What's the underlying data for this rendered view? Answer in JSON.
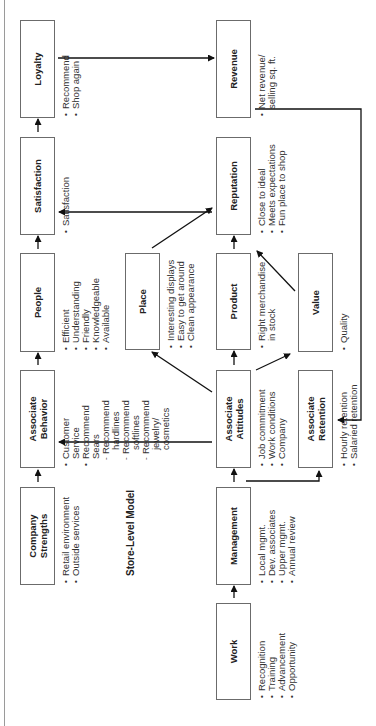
{
  "title": "Store-Level Model",
  "boxes": {
    "loyalty": {
      "label": "Loyalty",
      "bullets": [
        "Recommend",
        "Shop again"
      ]
    },
    "satisfaction": {
      "label": "Satisfaction",
      "bullets": [
        "Satisfaction"
      ]
    },
    "people": {
      "label": "People",
      "bullets": [
        "Efficient",
        "Understanding",
        "Friendly",
        "Knowledgeable",
        "Available"
      ]
    },
    "associate_behavior": {
      "label_line1": "Associate",
      "label_line2": "Behavior",
      "bullets": [
        "Customer",
        "Service",
        "Recommend",
        "Sears",
        "Recommend",
        "hardlines",
        "Recommend",
        "softlines",
        "Recommend",
        "jewelry/",
        "cosmetics"
      ]
    },
    "company_strengths": {
      "label_line1": "Company",
      "label_line2": "Strengths",
      "bullets": [
        "Retail environment",
        "Outside services"
      ]
    },
    "place": {
      "label": "Place",
      "bullets": [
        "Interesting displays",
        "Easy to get around",
        "Clean appearance"
      ]
    },
    "revenue": {
      "label": "Revenue",
      "bullets": [
        "Net revenue/",
        "selling sq. ft."
      ]
    },
    "reputation": {
      "label": "Reputation",
      "bullets": [
        "Close to ideal",
        "Meets expectations",
        "Fun place to shop"
      ]
    },
    "product": {
      "label": "Product",
      "bullets": [
        "Right merchandise",
        "in stock"
      ]
    },
    "associate_attitudes": {
      "label_line1": "Associate",
      "label_line2": "Attitudes",
      "bullets": [
        "Job commitment",
        "Work conditions",
        "Company"
      ]
    },
    "management": {
      "label": "Management",
      "bullets": [
        "Local mgmt.",
        "Dev. associates",
        "Upper mgmt.",
        "Annual review"
      ]
    },
    "work": {
      "label": "Work",
      "bullets": [
        "Recognition",
        "Training",
        "Advancement",
        "Opportunity"
      ]
    },
    "value": {
      "label": "Value",
      "bullets": [
        "Quality"
      ]
    },
    "associate_retention": {
      "label_line1": "Associate",
      "label_line2": "Retention",
      "bullets": [
        "Hourly retention",
        "Salaried retention"
      ]
    }
  },
  "edges": [
    {
      "from": "work",
      "to": "management"
    },
    {
      "from": "management",
      "to": "associate_attitudes"
    },
    {
      "from": "company_strengths",
      "to": "associate_behavior"
    },
    {
      "from": "associate_attitudes",
      "to": "associate_behavior"
    },
    {
      "from": "associate_attitudes",
      "to": "place"
    },
    {
      "from": "associate_attitudes",
      "to": "product"
    },
    {
      "from": "associate_attitudes",
      "to": "value"
    },
    {
      "from": "associate_attitudes",
      "to": "associate_retention"
    },
    {
      "from": "associate_behavior",
      "to": "people"
    },
    {
      "from": "people",
      "to": "satisfaction"
    },
    {
      "from": "place",
      "to": "reputation"
    },
    {
      "from": "product",
      "to": "reputation"
    },
    {
      "from": "value",
      "to": "reputation"
    },
    {
      "from": "reputation",
      "to": "satisfaction"
    },
    {
      "from": "satisfaction",
      "to": "loyalty"
    },
    {
      "from": "loyalty",
      "to": "revenue"
    },
    {
      "from": "revenue",
      "to": "associate_retention"
    }
  ]
}
